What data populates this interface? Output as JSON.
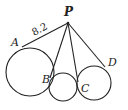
{
  "diagram": {
    "type": "geometry",
    "point_p": {
      "label": "P",
      "x": 68,
      "y": 23
    },
    "points": [
      {
        "label": "A",
        "x": 22,
        "y": 47,
        "label_x": 11,
        "label_y": 46
      },
      {
        "label": "B",
        "x": 50,
        "y": 78,
        "label_x": 42,
        "label_y": 83
      },
      {
        "label": "C",
        "x": 78,
        "y": 82,
        "label_x": 81,
        "label_y": 92
      },
      {
        "label": "D",
        "x": 105,
        "y": 67,
        "label_x": 108,
        "label_y": 66
      }
    ],
    "circles": [
      {
        "name": "circle-left",
        "cx": 30,
        "cy": 72,
        "r": 24
      },
      {
        "name": "circle-middle",
        "cx": 63,
        "cy": 87,
        "r": 14
      },
      {
        "name": "circle-right",
        "cx": 94,
        "cy": 83,
        "r": 17
      }
    ],
    "segment_label": {
      "text": "8.2",
      "segment": "PA",
      "x": 32,
      "y": 34
    }
  }
}
